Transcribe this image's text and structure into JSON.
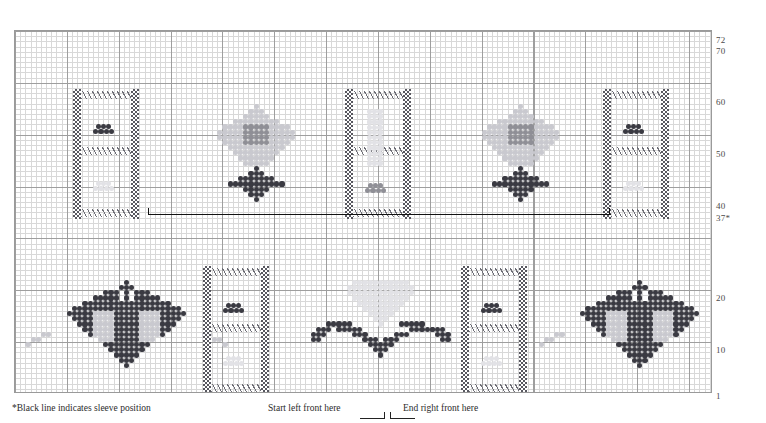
{
  "chart_data": {
    "type": "heatmap",
    "grid": {
      "columns": 134,
      "rows": 70,
      "cell_px": 5.185,
      "bold_every": 10,
      "grid_on": true
    },
    "xlabel": "",
    "ylabel": "Row",
    "ylim": [
      1,
      72
    ],
    "row_tick_labels": [
      "72",
      "70",
      "60",
      "50",
      "40",
      "37*",
      "20",
      "10",
      "1"
    ],
    "row_tick_values": [
      72,
      70,
      60,
      50,
      40,
      37,
      20,
      10,
      1
    ],
    "legend": [],
    "colors": {
      "dark": "#3a3a42",
      "mid": "#8f8f96",
      "light": "#c9c9cf",
      "pale": "#e2e2e6",
      "grid_fine": "#d8d8d8",
      "grid_bold": "#9e9e9e",
      "sleeve_line": "#111111",
      "frame": "#9a9a9a"
    },
    "annotations": [
      {
        "name": "sleeve-position-line",
        "text": "black horizontal line at row 37",
        "x_start_px": 147,
        "x_end_px": 610,
        "y_px": 213
      },
      {
        "name": "start-left-front",
        "text": "Start left front here"
      },
      {
        "name": "end-right-front",
        "text": "End right front here"
      }
    ],
    "series": [
      {
        "name": "top-fan-motifs",
        "count": 2,
        "shade": "mid+light over dark base"
      },
      {
        "name": "bottom-fan-motifs",
        "count": 3,
        "shade": "dark outline over light fill"
      },
      {
        "name": "braid-bands-top",
        "count": 3,
        "shade": "dark checker"
      },
      {
        "name": "braid-bands-bottom",
        "count": 2,
        "shade": "dark checker"
      }
    ]
  },
  "captions": {
    "sleeve_note": "*Black line indicates sleeve position",
    "start_left_front": "Start left front here",
    "end_right_front": "End right front here"
  },
  "row_numbers": [
    {
      "label": "72",
      "top": 6
    },
    {
      "label": "70",
      "top": 17
    },
    {
      "label": "60",
      "top": 68
    },
    {
      "label": "50",
      "top": 120
    },
    {
      "label": "40",
      "top": 172
    },
    {
      "label": "37*",
      "top": 184
    },
    {
      "label": "20",
      "top": 264
    },
    {
      "label": "10",
      "top": 316
    },
    {
      "label": "1",
      "top": 362
    }
  ]
}
